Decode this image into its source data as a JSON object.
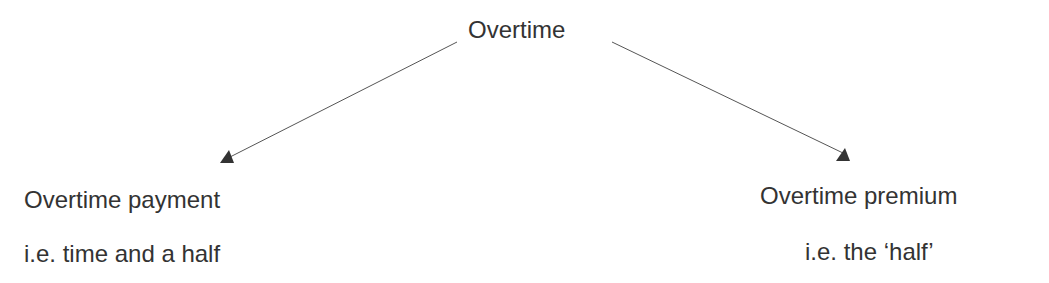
{
  "diagram": {
    "root": {
      "label": "Overtime"
    },
    "children": [
      {
        "title": "Overtime payment",
        "subtitle": "i.e. time and a half"
      },
      {
        "title": "Overtime premium",
        "subtitle": "i.e. the ‘half’"
      }
    ],
    "colors": {
      "text": "#333333",
      "line": "#555555",
      "arrowhead": "#333333"
    }
  }
}
